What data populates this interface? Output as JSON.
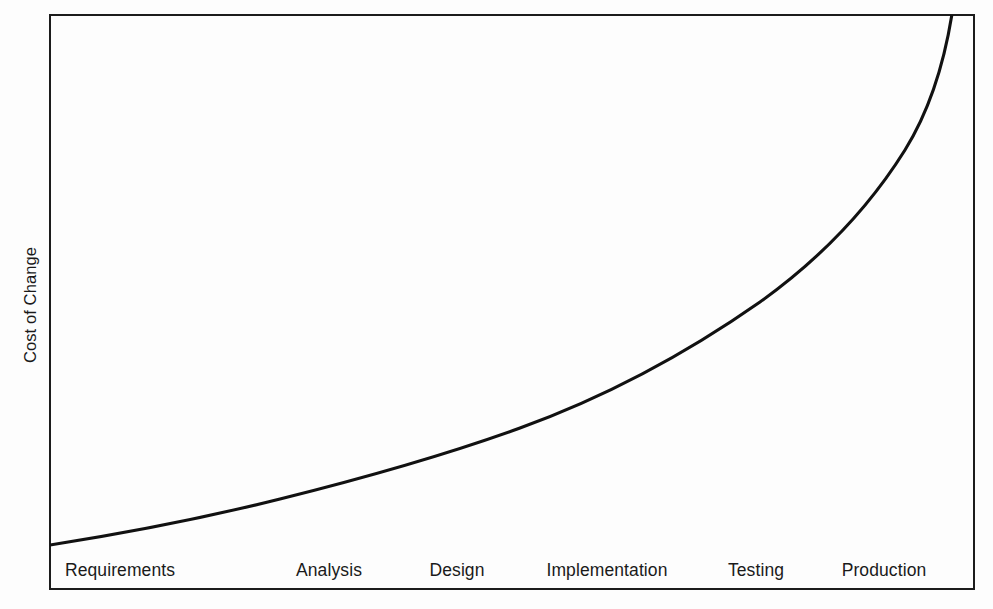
{
  "chart_data": {
    "type": "line",
    "title": "",
    "subtitle": "",
    "xlabel": "",
    "ylabel": "Cost of Change",
    "categories": [
      "Requirements",
      "Analysis",
      "Design",
      "Implementation",
      "Testing",
      "Production"
    ],
    "series": [
      {
        "name": "Cost of Change",
        "values": [
          1,
          2.1,
          3.4,
          6.2,
          13.5,
          34
        ],
        "points": [
          {
            "x": 0.0,
            "y": 1.0
          },
          {
            "x": 0.2,
            "y": 1.3
          },
          {
            "x": 0.4,
            "y": 1.8
          },
          {
            "x": 0.6,
            "y": 2.5
          },
          {
            "x": 0.8,
            "y": 3.4
          },
          {
            "x": 1.0,
            "y": 4.8
          },
          {
            "x": 1.2,
            "y": 6.6
          },
          {
            "x": 1.4,
            "y": 9.2
          },
          {
            "x": 1.6,
            "y": 13.0
          },
          {
            "x": 1.8,
            "y": 18.8
          },
          {
            "x": 1.95,
            "y": 26.0
          },
          {
            "x": 2.05,
            "y": 33.0
          }
        ]
      }
    ],
    "xlim": [
      0,
      2.05
    ],
    "ylim": [
      0,
      34
    ],
    "grid": false,
    "legend": false,
    "legend_position": "none",
    "annotations": [],
    "axis_tick_labels_y": [],
    "colors": {
      "curve": "#111111",
      "frame": "#1c1c1c",
      "background": "#fdfdfd",
      "text": "#1a1a1a"
    }
  },
  "figure": {
    "background_color": "#fdfdfd",
    "frame": {
      "name": "plot-frame",
      "left": 49,
      "top": 14,
      "width": 926,
      "height": 576,
      "border_color": "#1c1c1c",
      "border_width_px": 2
    },
    "curve_svg_path": "M 50 545 C 120 534, 200 519, 280 499 C 360 479, 440 457, 520 428 C 600 399, 680 358, 760 302 C 820 259, 870 206, 905 150 C 928 113, 943 70, 952 14",
    "y_axis_title": {
      "text": "Cost of Change",
      "center_x": 30,
      "center_y": 305,
      "rotation_deg": -90
    },
    "x_axis_labels": [
      {
        "text": "Requirements",
        "center_x": 120,
        "center_y": 570
      },
      {
        "text": "Analysis",
        "center_x": 329,
        "center_y": 570
      },
      {
        "text": "Design",
        "center_x": 457,
        "center_y": 570
      },
      {
        "text": "Implementation",
        "center_x": 607,
        "center_y": 570
      },
      {
        "text": "Testing",
        "center_x": 756,
        "center_y": 570
      },
      {
        "text": "Production",
        "center_x": 884,
        "center_y": 570
      }
    ]
  }
}
